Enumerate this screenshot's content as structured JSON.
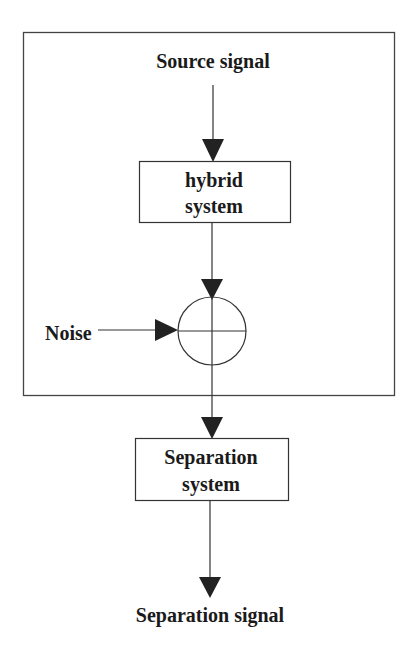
{
  "diagram": {
    "type": "signal-flow block diagram",
    "colors": {
      "stroke": "#333333",
      "text": "#1a1a1a",
      "background": "#ffffff"
    },
    "nodes": {
      "source": {
        "label": "Source signal"
      },
      "hybrid": {
        "line1": "hybrid",
        "line2": "system"
      },
      "summing_junction": {
        "symbol": "circle-plus"
      },
      "noise": {
        "label": "Noise"
      },
      "separation": {
        "line1": "Separation",
        "line2": "system"
      },
      "output": {
        "label": "Separation signal"
      }
    },
    "edges": [
      {
        "from": "Source signal",
        "to": "hybrid system"
      },
      {
        "from": "hybrid system",
        "to": "summing junction"
      },
      {
        "from": "Noise",
        "to": "summing junction"
      },
      {
        "from": "summing junction",
        "to": "Separation system"
      },
      {
        "from": "Separation system",
        "to": "Separation signal"
      }
    ],
    "groups": [
      {
        "name": "mixing-frame",
        "contains": [
          "Source signal",
          "hybrid system",
          "summing junction",
          "Noise"
        ]
      }
    ]
  }
}
